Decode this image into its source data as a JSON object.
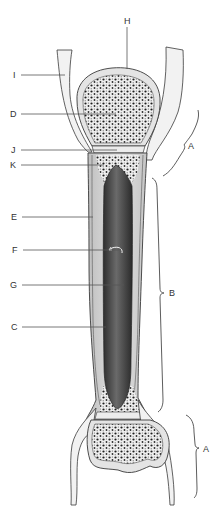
{
  "diagram": {
    "labels": [
      {
        "id": "H",
        "text": "H",
        "x": 124,
        "y": 16
      },
      {
        "id": "I",
        "text": "I",
        "x": 13,
        "y": 70
      },
      {
        "id": "D",
        "text": "D",
        "x": 10,
        "y": 109
      },
      {
        "id": "J",
        "text": "J",
        "x": 11,
        "y": 145
      },
      {
        "id": "K",
        "text": "K",
        "x": 10,
        "y": 160
      },
      {
        "id": "A1",
        "text": "A",
        "x": 188,
        "y": 141
      },
      {
        "id": "E",
        "text": "E",
        "x": 11,
        "y": 212
      },
      {
        "id": "F",
        "text": "F",
        "x": 12,
        "y": 245
      },
      {
        "id": "G",
        "text": "G",
        "x": 10,
        "y": 280
      },
      {
        "id": "B",
        "text": "B",
        "x": 169,
        "y": 288
      },
      {
        "id": "C",
        "text": "C",
        "x": 11,
        "y": 322
      },
      {
        "id": "A2",
        "text": "A",
        "x": 203,
        "y": 444
      }
    ],
    "colors": {
      "background": "#ffffff",
      "outline": "#3a3a3a",
      "cartilage": "#e6e6e6",
      "compact_bone": "#d4d4d4",
      "spongy_fill": "#ececec",
      "spongy_dots": "#1e1e1e",
      "marrow_cavity": "#4a4a4a",
      "leader_line": "#555555"
    }
  }
}
